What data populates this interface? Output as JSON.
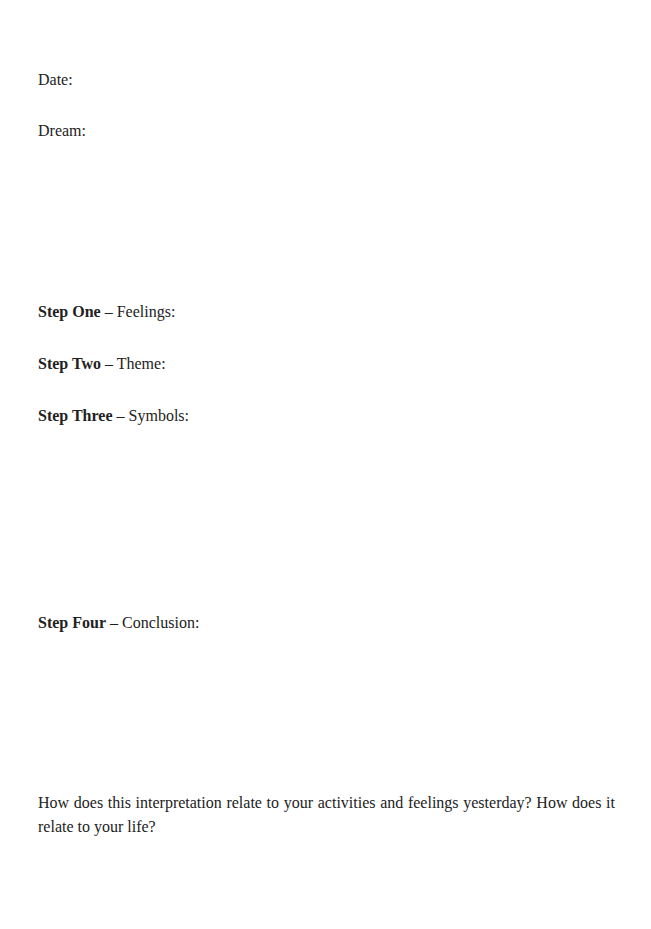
{
  "worksheet": {
    "date_label": "Date:",
    "dream_label": "Dream:",
    "steps": [
      {
        "title": "Step One",
        "separator": " – ",
        "label": "Feelings:"
      },
      {
        "title": "Step Two",
        "separator": " – ",
        "label": "Theme:"
      },
      {
        "title": "Step Three",
        "separator": " – ",
        "label": "Symbols:"
      },
      {
        "title": "Step Four",
        "separator": " – ",
        "label": "Conclusion:"
      }
    ],
    "reflection_question": "How does this interpretation relate to your activities and feelings yesterday? How does it relate to your life?"
  }
}
